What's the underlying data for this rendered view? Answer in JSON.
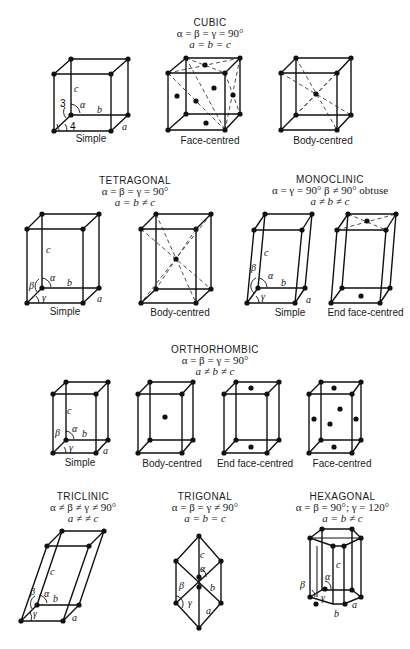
{
  "systems": {
    "cubic": {
      "title": "CUBIC",
      "angles": "α = β = γ = 90°",
      "lengths": "a = b = c",
      "lattices": [
        "Simple",
        "Face-centred",
        "Body-centred"
      ]
    },
    "tetragonal": {
      "title": "TETRAGONAL",
      "angles": "α = β = γ = 90°",
      "lengths": "a = b ≠ c",
      "lattices": [
        "Simple",
        "Body-centred"
      ]
    },
    "monoclinic": {
      "title": "MONOCLINIC",
      "angles": "α = γ = 90° β ≠ 90° obtuse",
      "lengths": "a ≠ b ≠ c",
      "lattices": [
        "Simple",
        "End face-centred"
      ]
    },
    "orthorhombic": {
      "title": "ORTHORHOMBIC",
      "angles": "α = β = γ = 90°",
      "lengths": "a ≠ b ≠ c",
      "lattices": [
        "Simple",
        "Body-centred",
        "End face-centred",
        "Face-centred"
      ]
    },
    "triclinic": {
      "title": "TRICLINIC",
      "angles": "α ≠ β ≠ γ ≠ 90°",
      "lengths": "a ≠ ≠ c"
    },
    "trigonal": {
      "title": "TRIGONAL",
      "angles": "α = β = γ ≠ 90°",
      "lengths": "a = b = c"
    },
    "hexagonal": {
      "title": "HEXAGONAL",
      "angles": "α = β = 90°; γ = 120°",
      "lengths": "a = b ≠ c"
    }
  },
  "axis_labels": {
    "a": "a",
    "b": "b",
    "c": "c",
    "alpha": "α",
    "beta": "β",
    "gamma": "γ",
    "n3": "3",
    "n4": "4"
  }
}
